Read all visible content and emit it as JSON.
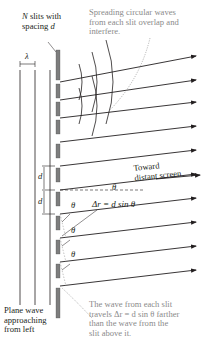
{
  "labels": {
    "slits_line1_var": "N",
    "slits_line1_rest": " slits with",
    "slits_line2_rest": "spacing ",
    "slits_line2_var": "d",
    "wavelength": "λ",
    "spreading_line1": "Spreading circular waves",
    "spreading_line2": "from each slit overlap and",
    "spreading_line3": "interfere.",
    "d_upper": "d",
    "d_lower": "d",
    "theta_center": "θ",
    "toward_line1": "Toward",
    "toward_line2": "distant screen",
    "delta_r_eq": "Δr = d sin θ",
    "theta_1": "θ",
    "theta_2": "θ",
    "theta_3": "θ",
    "plane_line1": "Plane wave",
    "plane_line2": "approaching",
    "plane_line3": "from left",
    "travel_line1": "The wave from each slit",
    "travel_line2": "travels Δr = d sin θ farther",
    "travel_line3": "than the wave from the",
    "travel_line4": "slit above it."
  },
  "colors": {
    "ink": "#231f20",
    "annotation_gray": "#8a8a8a",
    "slit_bar": "#7d7d7d"
  },
  "geometry": {
    "slit_x": 58,
    "slit_y": [
      66,
      90,
      114,
      138,
      162,
      186,
      210,
      234,
      258,
      282,
      306
    ],
    "ray_count": 10
  }
}
